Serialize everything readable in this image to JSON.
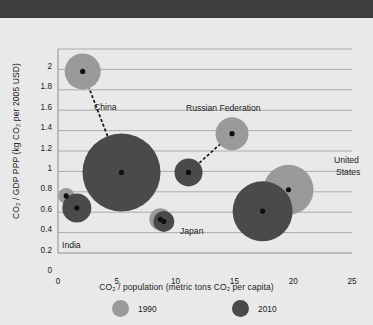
{
  "page": {
    "background_color": "#e9e9e9",
    "header_bar_color": "#3d3d3d"
  },
  "legend": {
    "position": "bottom",
    "entries": [
      {
        "label": "1990",
        "color": "#9a9a9a"
      },
      {
        "label": "2010",
        "color": "#4a4a4a"
      }
    ]
  },
  "chart_data": {
    "type": "scatter",
    "subtype": "bubble",
    "title": "",
    "xlabel": "CO₂ / population (metric tons CO₂ per capita)",
    "ylabel": "CO₂ / GDP PPP (kg CO₂ per 2005 USD)",
    "xlim": [
      0,
      25
    ],
    "ylim": [
      0,
      2
    ],
    "xticks": [
      "0",
      "5",
      "10",
      "15",
      "20",
      "25"
    ],
    "yticks": [
      "0",
      "0.2",
      "0.4",
      "0.6",
      "0.8",
      "1",
      "1.2",
      "1.4",
      "1.6",
      "1.8",
      "2"
    ],
    "grid": "horizontal",
    "series": [
      {
        "name": "1990",
        "color": "#9a9a9a"
      },
      {
        "name": "2010",
        "color": "#4a4a4a"
      }
    ],
    "points": [
      {
        "country": "China",
        "year": 1990,
        "x": 2.1,
        "y": 1.78,
        "size": 36,
        "color": "#9a9a9a"
      },
      {
        "country": "China",
        "year": 2010,
        "x": 5.4,
        "y": 0.79,
        "size": 78,
        "color": "#4a4a4a"
      },
      {
        "country": "India",
        "year": 1990,
        "x": 0.7,
        "y": 0.56,
        "size": 16,
        "color": "#9a9a9a"
      },
      {
        "country": "India",
        "year": 2010,
        "x": 1.6,
        "y": 0.44,
        "size": 29,
        "color": "#4a4a4a"
      },
      {
        "country": "Japan",
        "year": 1990,
        "x": 8.7,
        "y": 0.33,
        "size": 22,
        "color": "#9a9a9a"
      },
      {
        "country": "Japan",
        "year": 2010,
        "x": 9.0,
        "y": 0.31,
        "size": 21,
        "color": "#4a4a4a"
      },
      {
        "country": "Russian Federation",
        "year": 1990,
        "x": 14.8,
        "y": 1.17,
        "size": 33,
        "color": "#9a9a9a"
      },
      {
        "country": "Russian Federation",
        "year": 2010,
        "x": 11.1,
        "y": 0.79,
        "size": 28,
        "color": "#4a4a4a"
      },
      {
        "country": "United States",
        "year": 1990,
        "x": 19.6,
        "y": 0.62,
        "size": 50,
        "color": "#9a9a9a"
      },
      {
        "country": "United States",
        "year": 2010,
        "x": 17.4,
        "y": 0.41,
        "size": 60,
        "color": "#4a4a4a"
      }
    ],
    "connectors": [
      {
        "country": "China",
        "from": [
          2.1,
          1.78
        ],
        "to": [
          5.4,
          0.79
        ]
      },
      {
        "country": "India",
        "from": [
          0.7,
          0.56
        ],
        "to": [
          1.6,
          0.44
        ]
      },
      {
        "country": "Japan",
        "from": [
          8.7,
          0.33
        ],
        "to": [
          9.0,
          0.31
        ]
      },
      {
        "country": "Russian Federation",
        "from": [
          14.8,
          1.17
        ],
        "to": [
          11.1,
          0.79
        ]
      },
      {
        "country": "United States",
        "from": [
          19.6,
          0.62
        ],
        "to": [
          17.4,
          0.41
        ]
      }
    ],
    "annotations": [
      {
        "text": "China",
        "x": 94,
        "y": 84
      },
      {
        "text": "India",
        "x": 62,
        "y": 222
      },
      {
        "text": "Japan",
        "x": 180,
        "y": 208
      },
      {
        "text": "Russian Federation",
        "x": 186,
        "y": 85
      },
      {
        "text": "United",
        "x": 334,
        "y": 137
      },
      {
        "text": "States",
        "x": 336,
        "y": 149
      }
    ]
  }
}
